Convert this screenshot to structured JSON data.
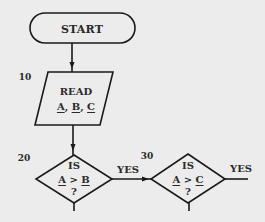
{
  "diagram": {
    "type": "flowchart",
    "colors": {
      "background": "#ececec",
      "stroke": "#1a1a1a",
      "text": "#2a2a2a"
    },
    "nodes": [
      {
        "id": "start",
        "shape": "terminal",
        "label": "START"
      },
      {
        "id": "read",
        "shape": "parallelogram",
        "step": "10",
        "line1": "READ",
        "vars": [
          "A",
          "B",
          "C"
        ],
        "separator": ", "
      },
      {
        "id": "decision-1",
        "shape": "diamond",
        "step": "20",
        "line1": "IS",
        "left": "A",
        "op": ">",
        "right": "B",
        "line3": "?"
      },
      {
        "id": "decision-2",
        "shape": "diamond",
        "step": "30",
        "line1": "IS",
        "left": "A",
        "op": ">",
        "right": "C",
        "line3": "?"
      }
    ],
    "edges": [
      {
        "from": "start",
        "to": "read",
        "label": ""
      },
      {
        "from": "read",
        "to": "decision-1",
        "label": ""
      },
      {
        "from": "decision-1",
        "to": "decision-2",
        "label": "YES"
      },
      {
        "from": "decision-2",
        "to": "offscreen-right",
        "label": "YES"
      }
    ]
  }
}
